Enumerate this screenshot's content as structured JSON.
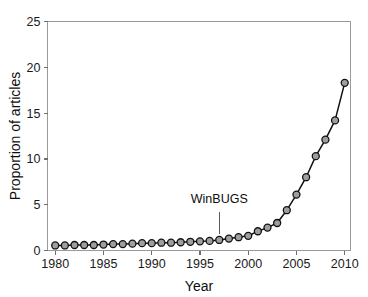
{
  "figure": {
    "background_color": "#ffffff",
    "axis_color": "#9a9a9a",
    "line_color": "#111111",
    "marker_fill_color": "#9e9e9e",
    "marker_edge_color": "#111111"
  },
  "chart_data": {
    "type": "line",
    "title": "",
    "xlabel": "Year",
    "ylabel": "Proportion of articles",
    "xlim": [
      1979.2,
      2010.6
    ],
    "ylim": [
      0,
      25
    ],
    "xticks": [
      1980,
      1985,
      1990,
      1995,
      2000,
      2005,
      2010
    ],
    "xticklabels": [
      "1980",
      "1985",
      "1990",
      "1995",
      "2000",
      "2005",
      "2010"
    ],
    "yticks": [
      0,
      5,
      10,
      15,
      20,
      25
    ],
    "yticklabels": [
      "0",
      "5",
      "10",
      "15",
      "20",
      "25"
    ],
    "grid": false,
    "legend": null,
    "marker": "circle",
    "x": [
      1980,
      1981,
      1982,
      1983,
      1984,
      1985,
      1986,
      1987,
      1988,
      1989,
      1990,
      1991,
      1992,
      1993,
      1994,
      1995,
      1996,
      1997,
      1998,
      1999,
      2000,
      2001,
      2002,
      2003,
      2004,
      2005,
      2006,
      2007,
      2008,
      2009,
      2010
    ],
    "values": [
      0.55,
      0.55,
      0.6,
      0.6,
      0.6,
      0.65,
      0.7,
      0.7,
      0.75,
      0.8,
      0.8,
      0.85,
      0.85,
      0.9,
      0.95,
      1.0,
      1.05,
      1.15,
      1.3,
      1.45,
      1.6,
      2.1,
      2.5,
      3.0,
      4.4,
      6.1,
      8.0,
      10.3,
      12.1,
      14.2,
      18.3
    ],
    "annotations": [
      {
        "text": "WinBUGS",
        "x": 1997,
        "label_y": 5.2,
        "pointer_from_y": 4.2,
        "pointer_to_y": 1.8
      }
    ]
  }
}
